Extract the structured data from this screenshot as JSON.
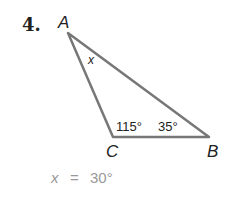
{
  "problem": {
    "number": "4.",
    "vertices": {
      "A": "A",
      "B": "B",
      "C": "C"
    },
    "angles": {
      "A": "x",
      "C": "115°",
      "B": "35°"
    },
    "answer_var": "x",
    "answer_eq": "=",
    "answer_val": "30°"
  },
  "colors": {
    "stroke": "#777777",
    "text": "#222222",
    "answer": "#999999"
  }
}
